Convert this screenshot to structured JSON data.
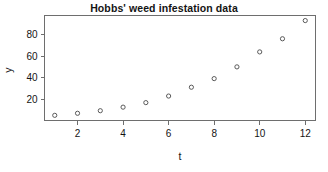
{
  "chart_data": {
    "type": "scatter",
    "title": "Hobbs' weed infestation data",
    "xlabel": "t",
    "ylabel": "y",
    "x": [
      1,
      2,
      3,
      4,
      5,
      6,
      7,
      8,
      9,
      10,
      11,
      12
    ],
    "values": [
      5.3,
      7.2,
      9.6,
      12.9,
      17.1,
      23.2,
      31.4,
      39.4,
      50.3,
      64.2,
      76.4,
      93.3
    ],
    "xticks": [
      "2",
      "4",
      "6",
      "8",
      "10",
      "12"
    ],
    "xtick_values": [
      2,
      4,
      6,
      8,
      10,
      12
    ],
    "yticks": [
      "20",
      "40",
      "60",
      "80"
    ],
    "ytick_values": [
      20,
      40,
      60,
      80
    ],
    "xlim": [
      0.55,
      12.45
    ],
    "ylim": [
      0.5,
      98
    ],
    "grid": false,
    "legend": false,
    "marker": "open-circle",
    "marker_color": "#5a5a5a",
    "frame_color": "#6e6e6e",
    "background": "#ffffff"
  },
  "axis": {
    "x_tick_labels": [
      "2",
      "4",
      "6",
      "8",
      "10",
      "12"
    ],
    "y_tick_labels": [
      "20",
      "40",
      "60",
      "80"
    ],
    "x_title": "t",
    "y_title": "y"
  }
}
